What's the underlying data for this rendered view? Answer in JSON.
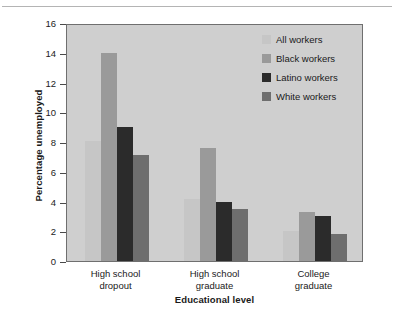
{
  "chart_data": {
    "type": "bar",
    "title": "",
    "xlabel": "Educational level",
    "ylabel": "Percentage unemployed",
    "categories": [
      "High school dropout",
      "High school graduate",
      "College graduate"
    ],
    "category_lines": [
      [
        "High school",
        "dropout"
      ],
      [
        "High school",
        "graduate"
      ],
      [
        "College",
        "graduate"
      ]
    ],
    "series": [
      {
        "name": "All workers",
        "color": "#c6c6c6",
        "values": [
          8.1,
          4.2,
          2.0
        ]
      },
      {
        "name": "Black workers",
        "color": "#9a9a9a",
        "values": [
          14.0,
          7.6,
          3.3
        ]
      },
      {
        "name": "Latino workers",
        "color": "#2b2b2b",
        "values": [
          9.0,
          4.0,
          3.0
        ]
      },
      {
        "name": "White workers",
        "color": "#6e6e6e",
        "values": [
          7.1,
          3.5,
          1.8
        ]
      }
    ],
    "ylim": [
      0,
      16
    ],
    "ytick_step": 2,
    "yticks": [
      "16",
      "14",
      "12",
      "10",
      "8",
      "6",
      "4",
      "2",
      "0"
    ],
    "grid": false,
    "legend_position": "top-right",
    "plot_background": "#cfcfcf",
    "axis_color": "#6f6f6f"
  },
  "legend": {
    "entries": [
      {
        "label": "All workers"
      },
      {
        "label": "Black workers"
      },
      {
        "label": "Latino workers"
      },
      {
        "label": "White workers"
      }
    ]
  }
}
